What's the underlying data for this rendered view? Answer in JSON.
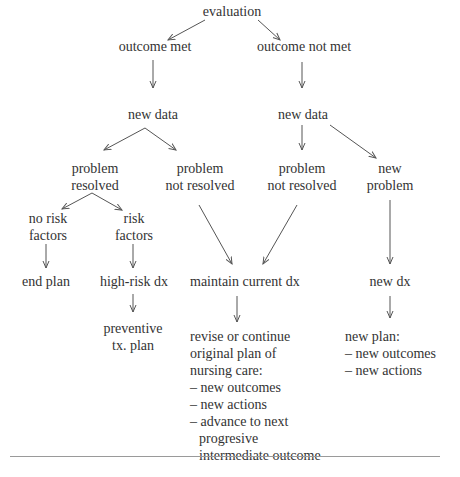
{
  "diagram": {
    "type": "flowchart",
    "nodes": {
      "evaluation": [
        "evaluation"
      ],
      "outcome_met": [
        "outcome met"
      ],
      "outcome_not_met": [
        "outcome not met"
      ],
      "new_data_met": [
        "new data"
      ],
      "new_data_not_met": [
        "new data"
      ],
      "problem_resolved": [
        "problem",
        "resolved"
      ],
      "problem_not_resolved_a": [
        "problem",
        "not resolved"
      ],
      "problem_not_resolved_b": [
        "problem",
        "not resolved"
      ],
      "new_problem": [
        "new",
        "problem"
      ],
      "no_risk_factors": [
        "no risk",
        "factors"
      ],
      "risk_factors": [
        "risk",
        "factors"
      ],
      "end_plan": [
        "end plan"
      ],
      "high_risk_dx": [
        "high-risk dx"
      ],
      "maintain_current_dx": [
        "maintain current dx"
      ],
      "new_dx": [
        "new dx"
      ],
      "preventive_plan": [
        "preventive",
        "tx. plan"
      ],
      "revise_plan": [
        "revise or continue",
        "original plan of",
        "nursing care:",
        "– new outcomes",
        "– new actions",
        "– advance to next",
        "  progresive",
        "  intermediate outcome"
      ],
      "new_plan": [
        "new plan:",
        "– new outcomes",
        "– new actions"
      ]
    },
    "edges": [
      [
        "evaluation",
        "outcome_met"
      ],
      [
        "evaluation",
        "outcome_not_met"
      ],
      [
        "outcome_met",
        "new_data_met"
      ],
      [
        "outcome_not_met",
        "new_data_not_met"
      ],
      [
        "new_data_met",
        "problem_resolved"
      ],
      [
        "new_data_met",
        "problem_not_resolved_a"
      ],
      [
        "new_data_not_met",
        "problem_not_resolved_b"
      ],
      [
        "new_data_not_met",
        "new_problem"
      ],
      [
        "problem_resolved",
        "no_risk_factors"
      ],
      [
        "problem_resolved",
        "risk_factors"
      ],
      [
        "no_risk_factors",
        "end_plan"
      ],
      [
        "risk_factors",
        "high_risk_dx"
      ],
      [
        "problem_not_resolved_a",
        "maintain_current_dx"
      ],
      [
        "problem_not_resolved_b",
        "maintain_current_dx"
      ],
      [
        "new_problem",
        "new_dx"
      ],
      [
        "high_risk_dx",
        "preventive_plan"
      ],
      [
        "maintain_current_dx",
        "revise_plan"
      ],
      [
        "new_dx",
        "new_plan"
      ]
    ]
  }
}
